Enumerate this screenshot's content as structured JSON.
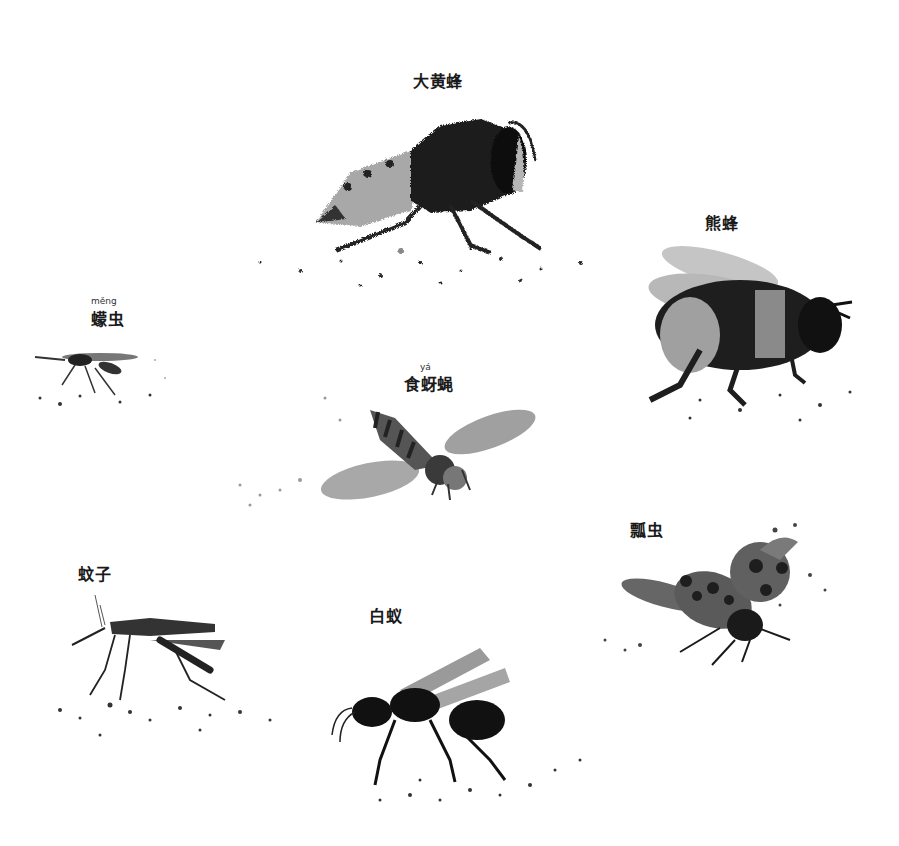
{
  "illustration": {
    "style": "grayscale painted collage",
    "insects": [
      {
        "id": "hornet",
        "label": "大黄蜂",
        "pinyin": null
      },
      {
        "id": "bumblebee",
        "label": "熊蜂",
        "pinyin": null
      },
      {
        "id": "midge",
        "label": "蠓虫",
        "pinyin": "měng"
      },
      {
        "id": "hoverfly",
        "label": "食蚜蝇",
        "pinyin": "yá"
      },
      {
        "id": "ladybug",
        "label": "瓢虫",
        "pinyin": null
      },
      {
        "id": "mosquito",
        "label": "蚊子",
        "pinyin": null
      },
      {
        "id": "termite",
        "label": "白蚁",
        "pinyin": null
      }
    ]
  },
  "colors": {
    "ink": "#1a1a1a",
    "mid": "#6b6b6b",
    "light": "#b5b5b5",
    "background": "#ffffff"
  }
}
